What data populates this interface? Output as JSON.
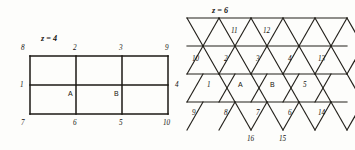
{
  "figure": {
    "title": "",
    "background_color": "#fdfdfb",
    "ink_color": "#1b1814",
    "left_panel": {
      "name": "square-lattice-z4",
      "coordination_label": "z = 4",
      "lattice_type": "square",
      "columns": 3,
      "rows": 2,
      "site_labels": {
        "top_left": "8",
        "top_mid_left": "2",
        "top_mid_right": "3",
        "top_right": "9",
        "left_mid": "1",
        "right_mid": "4",
        "bottom_left": "7",
        "bottom_mid_left": "6",
        "bottom_mid_right": "5",
        "bottom_right": "10"
      },
      "interior_labels": {
        "a": "A",
        "b": "B"
      }
    },
    "right_panel": {
      "name": "triangular-lattice-z6",
      "coordination_label": "z = 6",
      "lattice_type": "triangular",
      "rows": 4,
      "row_labels": {
        "row1": [
          "11",
          "12"
        ],
        "row2": [
          "10",
          "2",
          "3",
          "4",
          "13"
        ],
        "row3": [
          "1",
          "A",
          "B",
          "5"
        ],
        "row4": [
          "9",
          "8",
          "7",
          "6",
          "14"
        ],
        "row5": [
          "16",
          "15"
        ]
      }
    }
  }
}
